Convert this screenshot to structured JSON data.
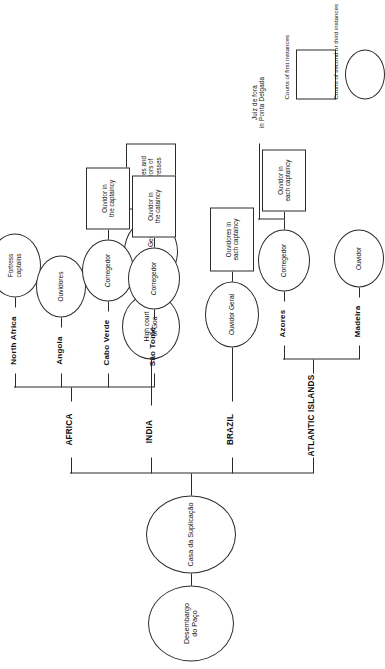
{
  "diagram": {
    "root": {
      "desembargo": "Desembargo\ndo Paço",
      "casa": "Casa da Suplicação"
    },
    "regions": [
      {
        "id": "atlantic-islands",
        "label": "ATLANTIC ISLANDS"
      },
      {
        "id": "brazil",
        "label": "BRAZIL"
      },
      {
        "id": "india",
        "label": "INDIA"
      },
      {
        "id": "africa",
        "label": "AFRICA"
      }
    ],
    "subregions": [
      {
        "id": "madeira",
        "label": "Madeira"
      },
      {
        "id": "azores",
        "label": "Azores"
      },
      {
        "id": "sao-tome",
        "label": "São Tomé"
      },
      {
        "id": "cabo-verde",
        "label": "Cabo Verde"
      },
      {
        "id": "angola",
        "label": "Angola"
      },
      {
        "id": "north-africa",
        "label": "North Africa"
      }
    ],
    "nodes": {
      "madeira_ouvidor": "Ouvidor",
      "azores_corregedor": "Corregedor",
      "azores_ouvidor_box": "Ouvidor in\neach captaincy",
      "azores_juiz": "Juiz de fora\nin Ponta Delgada",
      "brazil_ouvidor_geral": "Ouvidor Geral",
      "brazil_ouvidores_box": "Ouvidores in\neach captaincy",
      "india_high_court": "High court\nof Goa",
      "india_ouvidor_geral": "Ouvidor Geral",
      "india_fortresses_box": "Ouvidores and\nProvedors of\nthe fortresses",
      "sao_tome_corregedor": "Corregedor",
      "sao_tome_ouvidor_box": "Ouvidor in\nthe cataincy",
      "cabo_verde_corregedor": "Corregedor",
      "cabo_verde_ouvidor_box": "Ouvidor in\nthe captaincy",
      "angola_ouvidores": "Ouvidores",
      "north_africa_captains": "Fortress\ncaptains"
    },
    "legend": [
      {
        "id": "first-instance",
        "shape": "rect",
        "label": "Courts of first instances"
      },
      {
        "id": "higher-instance",
        "shape": "ellipse",
        "label": "Courts of second or third instances"
      }
    ],
    "colors": {
      "stroke": "#2b2b2b",
      "background": "#ffffff",
      "text": "#111111"
    }
  }
}
